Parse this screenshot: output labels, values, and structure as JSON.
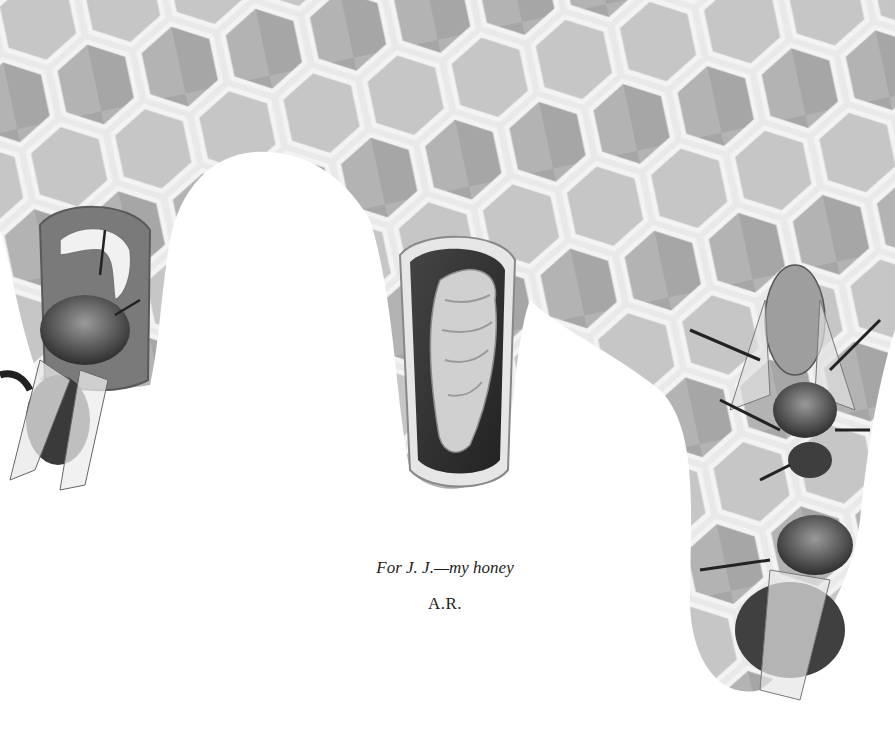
{
  "page": {
    "type": "book-dedication-page",
    "illustration": {
      "subject": "honeycomb-with-bees",
      "style": "graphite pencil drawing",
      "elements": [
        "capped-honeycomb-cells",
        "open-honeycomb-cells",
        "left-bee-emerging-from-cell-with-larva",
        "center-open-cell-with-pupa",
        "right-two-bees-on-comb"
      ]
    },
    "dedication": {
      "line1": "For J. J.—my honey",
      "line2": "A.R."
    },
    "colors": {
      "background": "#ffffff",
      "comb_light": "#cfcfcf",
      "comb_mid": "#a9a9a9",
      "cell_dark": "#7e7e7e",
      "wax_rim": "#f2f2f2",
      "text": "#1d1d1d"
    }
  }
}
